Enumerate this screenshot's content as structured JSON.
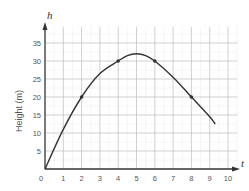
{
  "chart_data": {
    "type": "line",
    "title": "",
    "xlabel": "t",
    "ylabel": "Height (m)",
    "y_axis_var": "h",
    "x_axis_var": "t",
    "xlim": [
      0,
      10.5
    ],
    "ylim": [
      0,
      40
    ],
    "grid": true,
    "x_ticks": [
      0,
      1,
      2,
      3,
      4,
      5,
      6,
      7,
      8,
      9,
      10
    ],
    "x_tick_labels": [
      "0",
      "1",
      "2",
      "3",
      "4",
      "5",
      "6",
      "7",
      "8",
      "9",
      "10"
    ],
    "y_ticks": [
      5,
      10,
      15,
      20,
      25,
      30,
      35
    ],
    "y_tick_labels": [
      "5",
      "10",
      "15",
      "20",
      "25",
      "30",
      "35"
    ],
    "series": [
      {
        "name": "height",
        "curve": [
          {
            "x": 0,
            "y": 0
          },
          {
            "x": 1,
            "y": 11
          },
          {
            "x": 2,
            "y": 20
          },
          {
            "x": 3,
            "y": 26.5
          },
          {
            "x": 4,
            "y": 30
          },
          {
            "x": 4.5,
            "y": 31.5
          },
          {
            "x": 5,
            "y": 32
          },
          {
            "x": 5.5,
            "y": 31.5
          },
          {
            "x": 6,
            "y": 30
          },
          {
            "x": 7,
            "y": 25.5
          },
          {
            "x": 8,
            "y": 20
          },
          {
            "x": 9,
            "y": 14.5
          },
          {
            "x": 9.3,
            "y": 12.5
          }
        ],
        "markers": [
          {
            "x": 2,
            "y": 20
          },
          {
            "x": 4,
            "y": 30
          },
          {
            "x": 6,
            "y": 30
          },
          {
            "x": 8,
            "y": 20
          }
        ]
      }
    ],
    "legend": null
  },
  "colors": {
    "axis": "#333333",
    "grid_major": "#bbbbbb",
    "grid_minor": "#d8d8d8",
    "curve": "#333333",
    "text": "#555555"
  }
}
